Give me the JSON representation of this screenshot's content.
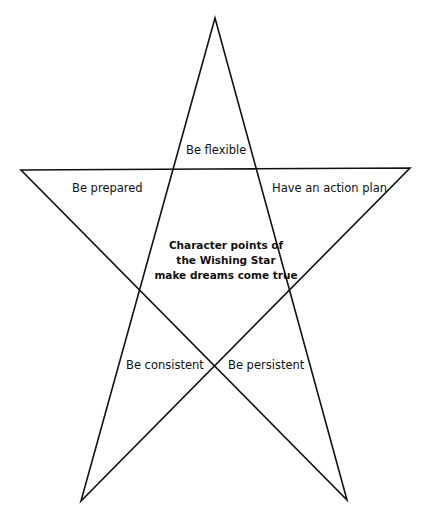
{
  "diagram": {
    "type": "pentagram",
    "line_color": "#111111",
    "background": "#ffffff",
    "vertices": {
      "top": [
        215,
        18
      ],
      "left": [
        21,
        170
      ],
      "right": [
        410,
        168
      ],
      "bottom_left": [
        81,
        501
      ],
      "bottom_right": [
        347,
        500
      ]
    },
    "points": {
      "top": "Be flexible",
      "left": "Be prepared",
      "right": "Have an action plan",
      "bottom_left": "Be consistent",
      "bottom_right": "Be persistent"
    },
    "center": {
      "line1": "Character points of",
      "line2": "the Wishing Star",
      "line3": "make dreams come true"
    }
  }
}
